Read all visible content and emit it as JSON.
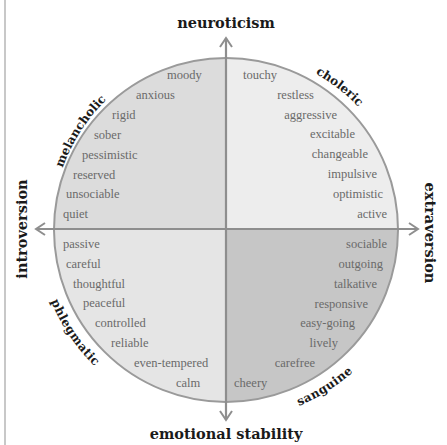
{
  "diagram": {
    "type": "four-temperaments-personality-circle",
    "axes": {
      "top": "neuroticism",
      "bottom": "emotional stability",
      "left": "introversion",
      "right": "extraversion"
    },
    "colors": {
      "top_left": "#dcdcdc",
      "top_right": "#ededed",
      "bottom_left": "#e5e5e5",
      "bottom_right": "#c6c6c6",
      "axis_line": "#8e8e8e",
      "circle_border": "#9a9a9a",
      "word_text": "#6a6a6a",
      "label_text": "#1a1a1a"
    },
    "quadrants": [
      {
        "id": "top-left",
        "temperament": "melancholic",
        "traits": [
          "moody",
          "anxious",
          "rigid",
          "sober",
          "pessimistic",
          "reserved",
          "unsociable",
          "quiet"
        ]
      },
      {
        "id": "top-right",
        "temperament": "choleric",
        "traits": [
          "touchy",
          "restless",
          "aggressive",
          "excitable",
          "changeable",
          "impulsive",
          "optimistic",
          "active"
        ]
      },
      {
        "id": "bottom-left",
        "temperament": "phlegmatic",
        "traits": [
          "passive",
          "careful",
          "thoughtful",
          "peaceful",
          "controlled",
          "reliable",
          "even-tempered",
          "calm"
        ]
      },
      {
        "id": "bottom-right",
        "temperament": "sanguine",
        "traits": [
          "sociable",
          "outgoing",
          "talkative",
          "responsive",
          "easy-going",
          "lively",
          "carefree",
          "cheery"
        ]
      }
    ]
  }
}
